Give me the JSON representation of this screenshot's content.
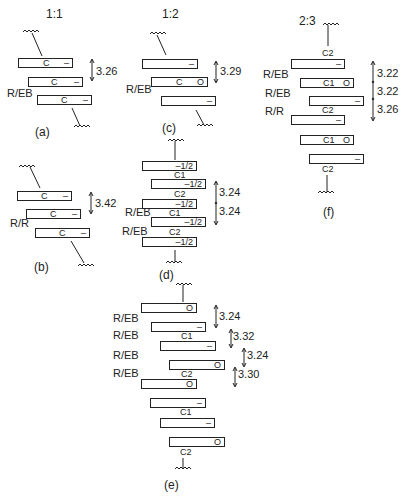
{
  "figure": {
    "panels": {
      "a": {
        "caption": "(a)",
        "ratio": "1:1",
        "stacking_label": "R/EB",
        "spacing": "3.26",
        "molecules": [
          {
            "center": "C",
            "end": "–"
          },
          {
            "center": "C",
            "end": "–"
          },
          {
            "center": "C",
            "end": "–"
          }
        ]
      },
      "b": {
        "caption": "(b)",
        "stacking_label": "R/R",
        "spacing": "3.42",
        "molecules": [
          {
            "center": "C",
            "end": "–"
          },
          {
            "center": "C",
            "end": "–"
          },
          {
            "center": "C",
            "end": "–"
          }
        ]
      },
      "c": {
        "caption": "(c)",
        "ratio": "1:2",
        "stacking_label": "R/EB",
        "spacing": "3.29",
        "molecules": [
          {
            "center": "",
            "end": "–"
          },
          {
            "center": "C",
            "end": "O"
          },
          {
            "center": "",
            "end": "–"
          }
        ]
      },
      "d": {
        "caption": "(d)",
        "stacking_labels": [
          "R/EB",
          "R/EB"
        ],
        "spacings": [
          "3.24",
          "3.24"
        ],
        "site_labels": [
          "C1",
          "C2",
          "C1",
          "C2"
        ],
        "molecules": [
          {
            "end": "–1/2"
          },
          {
            "end": "–1/2"
          },
          {
            "end": "–1/2"
          },
          {
            "end": "–1/2"
          },
          {
            "end": "–1/2"
          }
        ]
      },
      "e": {
        "caption": "(e)",
        "stacking_labels": [
          "R/EB",
          "R/EB",
          "R/EB",
          "R/EB"
        ],
        "spacings": [
          "3.24",
          "3.32",
          "3.24",
          "3.30"
        ],
        "site_labels": [
          "C1",
          "C2",
          "C1",
          "C2"
        ],
        "molecules": [
          {
            "end": "O"
          },
          {
            "end": "–"
          },
          {
            "end": "–"
          },
          {
            "end": "O"
          },
          {
            "end": "O"
          },
          {
            "end": "–"
          },
          {
            "end": "–"
          },
          {
            "end": "O"
          }
        ]
      },
      "f": {
        "caption": "(f)",
        "ratio": "2:3",
        "stacking_labels": [
          "R/EB",
          "R/EB",
          "R/R"
        ],
        "spacings": [
          "3.22",
          "3.22",
          "3.26"
        ],
        "site_labels": [
          "C2",
          "C1",
          "C2",
          "C1",
          "C2"
        ],
        "molecules": [
          {
            "end": "–"
          },
          {
            "end": "O"
          },
          {
            "end": "–"
          },
          {
            "end": "–"
          },
          {
            "end": "O"
          },
          {
            "end": "–"
          }
        ]
      }
    }
  }
}
